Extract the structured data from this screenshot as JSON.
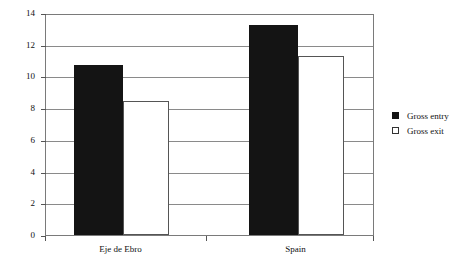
{
  "chart_data": {
    "type": "bar",
    "title": "",
    "xlabel": "",
    "ylabel": "",
    "categories": [
      "Eje de Ebro",
      "Spain"
    ],
    "series": [
      {
        "name": "Gross entry",
        "color": "#141414",
        "values": [
          10.7,
          13.25
        ]
      },
      {
        "name": "Gross exit",
        "color": "#ffffff",
        "values": [
          8.45,
          11.3
        ]
      }
    ],
    "ylim": [
      0,
      14
    ],
    "ytick_step": 2,
    "yticks": [
      "0",
      "2",
      "4",
      "6",
      "8",
      "10",
      "12",
      "14"
    ],
    "grid": true,
    "legend_position": "right"
  },
  "legend": {
    "items": [
      {
        "label": "Gross entry",
        "marker": "filled-square"
      },
      {
        "label": "Gross exit",
        "marker": "open-square"
      }
    ]
  },
  "axis": {
    "x_labels": [
      "Eje de Ebro",
      "Spain"
    ],
    "y_labels": [
      "14",
      "12",
      "10",
      "8",
      "6",
      "4",
      "2",
      "0"
    ]
  },
  "colors": {
    "entry_fill": "#141414",
    "exit_fill": "#ffffff",
    "frame": "#7a7a7a",
    "grid": "#8a8a8a",
    "text": "#111111"
  }
}
